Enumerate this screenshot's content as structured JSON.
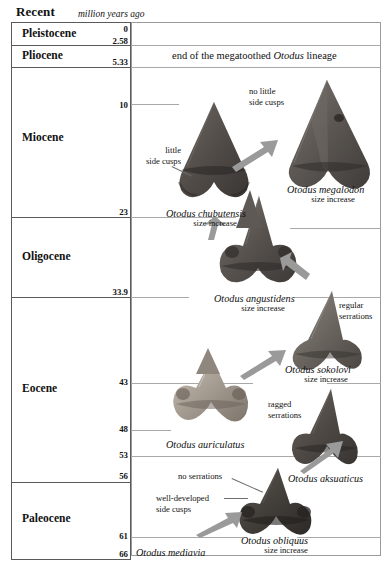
{
  "header": {
    "recent_label": "Recent",
    "units_label": "million years ago"
  },
  "timescale": {
    "epochs": [
      {
        "name": "Pleistocene",
        "top_ma": "0",
        "bottom_ma": "2.58"
      },
      {
        "name": "Pliocene",
        "top_ma": "2.58",
        "bottom_ma": "5.33"
      },
      {
        "name": "Miocene",
        "top_ma": "5.33",
        "bottom_ma": "23"
      },
      {
        "name": "Oligocene",
        "top_ma": "23",
        "bottom_ma": "33.9"
      },
      {
        "name": "Eocene",
        "top_ma": "33.9",
        "bottom_ma": "56"
      },
      {
        "name": "Paleocene",
        "top_ma": "56",
        "bottom_ma": "66"
      }
    ],
    "tick_labels": [
      "0",
      "2.58",
      "5.33",
      "10",
      "23",
      "33.9",
      "43",
      "48",
      "53",
      "56",
      "61",
      "66"
    ]
  },
  "banner": {
    "text_before": "end of the megatoothed ",
    "genus": "Otodus",
    "text_after": " lineage"
  },
  "taxa": [
    {
      "name": "Otodus megalodon",
      "sub": "size increase"
    },
    {
      "name": "Otodus chubutensis",
      "sub": "size increase"
    },
    {
      "name": "Otodus angustidens",
      "sub": "size increase"
    },
    {
      "name": "Otodus sokolovi",
      "sub": "size increase"
    },
    {
      "name": "Otodus auriculatus",
      "sub": ""
    },
    {
      "name": "Otodus aksuaticus",
      "sub": ""
    },
    {
      "name": "Otodus obliquus",
      "sub": "size increase"
    },
    {
      "name": "Otodus mediavia",
      "sub": ""
    }
  ],
  "annotations": {
    "no_little_side_cusps_l1": "no little",
    "no_little_side_cusps_l2": "side cusps",
    "little_side_cusps_l1": "little",
    "little_side_cusps_l2": "side cusps",
    "regular_serrations_l1": "regular",
    "regular_serrations_l2": "serrations",
    "ragged_serrations_l1": "ragged",
    "ragged_serrations_l2": "serrations",
    "no_serrations": "no serrations",
    "well_developed_l1": "well-developed",
    "well_developed_l2": "side cusps"
  },
  "colors": {
    "frame": "#5a5a5a",
    "panel_border": "#9a9a9a",
    "tie_line": "#a8a8a8",
    "arrow": "#9a9a9a",
    "leader": "#6e6e6e",
    "tooth_dark": "#4a4745",
    "tooth_mid": "#6e6a66",
    "tooth_light": "#b5aca3",
    "text": "#111111"
  }
}
